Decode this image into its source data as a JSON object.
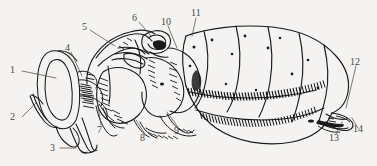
{
  "figure": {
    "kind": "scientific-line-drawing",
    "orientation": "lateral view, head at left, abdomen at right",
    "style": "black ink stipple and hatch line art",
    "background_color": "#f4f3f1",
    "ink_color": "#1a1a1a",
    "label_color": "#4a4845",
    "width": 377,
    "height": 166
  },
  "labels": [
    {
      "id": "1",
      "text": "1",
      "x": 14,
      "y": 70,
      "leader_to": "compound-eye"
    },
    {
      "id": "2",
      "text": "2",
      "x": 14,
      "y": 120,
      "leader_to": "antenna"
    },
    {
      "id": "3",
      "text": "3",
      "x": 52,
      "y": 148,
      "leader_to": "mouthparts-proboscis"
    },
    {
      "id": "4",
      "text": "4",
      "x": 66,
      "y": 45,
      "leader_to": "head-vertex"
    },
    {
      "id": "5",
      "text": "5",
      "x": 82,
      "y": 25,
      "leader_to": "pronotum"
    },
    {
      "id": "6",
      "text": "6",
      "x": 133,
      "y": 14,
      "leader_to": "scutellum-anterior"
    },
    {
      "id": "7",
      "text": "7",
      "x": 98,
      "y": 128,
      "leader_to": "prothoracic-leg-base"
    },
    {
      "id": "8",
      "text": "8",
      "x": 140,
      "y": 138,
      "leader_to": "mesothoracic-pleuron"
    },
    {
      "id": "9",
      "text": "9",
      "x": 175,
      "y": 130,
      "leader_to": "metathoracic-leg-base"
    },
    {
      "id": "10",
      "text": "10",
      "x": 163,
      "y": 18,
      "leader_to": "scutellum"
    },
    {
      "id": "11",
      "text": "11",
      "x": 193,
      "y": 10,
      "leader_to": "abdominal-tergite-1"
    },
    {
      "id": "12",
      "text": "12",
      "x": 352,
      "y": 57,
      "leader_to": "terminal-tergite"
    },
    {
      "id": "13",
      "text": "13",
      "x": 330,
      "y": 137,
      "leader_to": "sternite-fringe"
    },
    {
      "id": "14",
      "text": "14",
      "x": 355,
      "y": 131,
      "leader_to": "apex-cercus"
    }
  ],
  "regions": [
    {
      "name": "head",
      "note": "rounded capsule at far left bearing large compound eye"
    },
    {
      "name": "compound-eye",
      "note": "large oval eye occupying most of head in lateral view"
    },
    {
      "name": "antenna",
      "note": "slender appendage projecting antero-ventrally from head"
    },
    {
      "name": "mouthparts",
      "note": "elongate proboscis / labial structures directed ventrally"
    },
    {
      "name": "thorax",
      "note": "heavily hatched mesosoma with pronotum, mesoscutum and scutellum"
    },
    {
      "name": "legs",
      "note": "leg bases and coxae visible along ventral thoracic margin"
    },
    {
      "name": "abdomen",
      "note": "six visible tergites with dark setal fringes at posterior margins"
    },
    {
      "name": "abdomen-apex",
      "note": "tapering terminal segments at right"
    }
  ]
}
